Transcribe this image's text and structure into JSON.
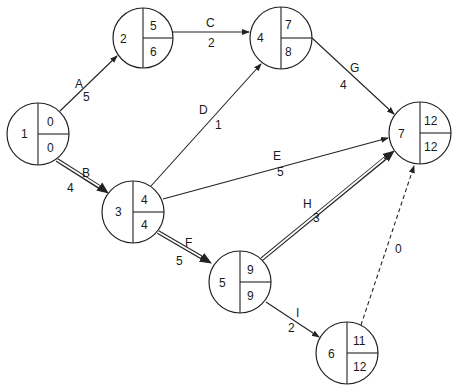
{
  "diagram": {
    "type": "activity-on-arrow network (critical path)",
    "nodes": [
      {
        "id": "1",
        "label": "1",
        "earliest": "0",
        "latest": "0",
        "cx": 38,
        "cy": 134
      },
      {
        "id": "2",
        "label": "2",
        "earliest": "5",
        "latest": "6",
        "cx": 143,
        "cy": 38
      },
      {
        "id": "3",
        "label": "3",
        "earliest": "4",
        "latest": "4",
        "cx": 133,
        "cy": 212
      },
      {
        "id": "4",
        "label": "4",
        "earliest": "7",
        "latest": "8",
        "cx": 281,
        "cy": 38
      },
      {
        "id": "5",
        "label": "5",
        "earliest": "9",
        "latest": "9",
        "cx": 240,
        "cy": 282
      },
      {
        "id": "6",
        "label": "6",
        "earliest": "11",
        "latest": "12",
        "cx": 347,
        "cy": 353
      },
      {
        "id": "7",
        "label": "7",
        "earliest": "12",
        "latest": "12",
        "cx": 420,
        "cy": 133
      }
    ],
    "edges": [
      {
        "activity": "A",
        "duration": "5",
        "from": "1",
        "to": "2",
        "style": "normal"
      },
      {
        "activity": "B",
        "duration": "4",
        "from": "1",
        "to": "3",
        "style": "critical"
      },
      {
        "activity": "C",
        "duration": "2",
        "from": "2",
        "to": "4",
        "style": "normal"
      },
      {
        "activity": "D",
        "duration": "1",
        "from": "3",
        "to": "4",
        "style": "normal"
      },
      {
        "activity": "E",
        "duration": "5",
        "from": "3",
        "to": "7",
        "style": "normal"
      },
      {
        "activity": "F",
        "duration": "5",
        "from": "3",
        "to": "5",
        "style": "critical"
      },
      {
        "activity": "G",
        "duration": "4",
        "from": "4",
        "to": "7",
        "style": "normal"
      },
      {
        "activity": "H",
        "duration": "3",
        "from": "5",
        "to": "7",
        "style": "critical"
      },
      {
        "activity": "I",
        "duration": "2",
        "from": "5",
        "to": "6",
        "style": "normal"
      },
      {
        "activity": "",
        "duration": "0",
        "from": "6",
        "to": "7",
        "style": "dummy"
      }
    ],
    "colors": {
      "line": "#222222",
      "text": "#1a1a1a",
      "background": "#ffffff"
    }
  }
}
